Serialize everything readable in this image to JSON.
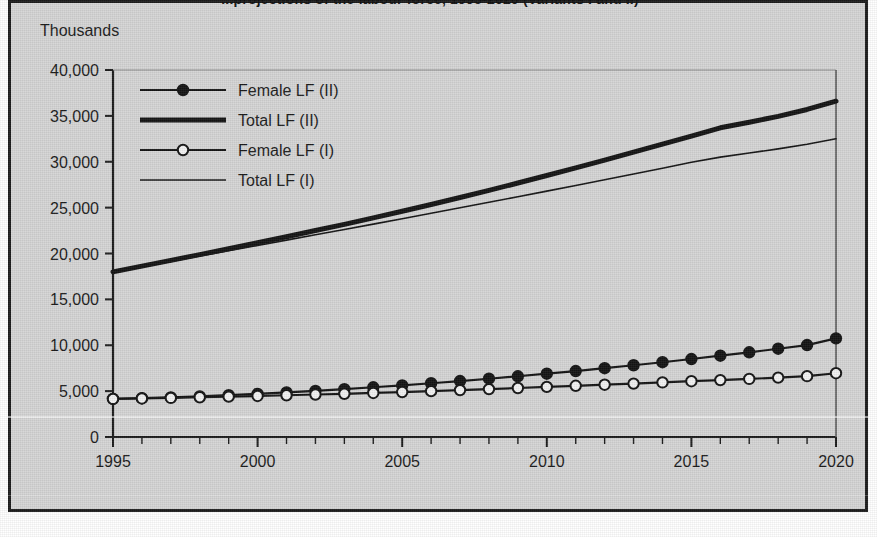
{
  "figure": {
    "title": "...projections of the labour force, 1995-2020 (Variants I and II)",
    "background_color": "#d5d5d5",
    "frame_color": "#1c1c1c"
  },
  "axes": {
    "y_unit_label": "Thousands",
    "y_ticks": [
      "0",
      "5,000",
      "10,000",
      "15,000",
      "20,000",
      "25,000",
      "30,000",
      "35,000",
      "40,000"
    ],
    "x_ticks": [
      "1995",
      "2000",
      "2005",
      "2010",
      "2015",
      "2020"
    ],
    "x_minor_tick_interval": 1
  },
  "legend": {
    "items": [
      {
        "label": "Female LF (II)",
        "marker": "filled-circle",
        "line_weight": "medium",
        "color": "#141414"
      },
      {
        "label": "Total LF (II)",
        "marker": "none",
        "line_weight": "thick",
        "color": "#141414"
      },
      {
        "label": "Female LF (I)",
        "marker": "open-circle",
        "line_weight": "medium",
        "color": "#141414"
      },
      {
        "label": "Total LF (I)",
        "marker": "none",
        "line_weight": "thin",
        "color": "#141414"
      }
    ]
  },
  "chart_data": {
    "type": "line",
    "title": "...projections of the labour force, 1995-2020 (Variants I and II)",
    "xlabel": "",
    "ylabel": "Thousands",
    "xlim": [
      1995,
      2020
    ],
    "ylim": [
      0,
      40000
    ],
    "grid": false,
    "legend_position": "top-left-inside",
    "x": [
      1995,
      1996,
      1997,
      1998,
      1999,
      2000,
      2001,
      2002,
      2003,
      2004,
      2005,
      2006,
      2007,
      2008,
      2009,
      2010,
      2011,
      2012,
      2013,
      2014,
      2015,
      2016,
      2017,
      2018,
      2019,
      2020
    ],
    "series": [
      {
        "name": "Total LF (II)",
        "marker": "none",
        "line_weight": "thick",
        "values": [
          18000,
          18620,
          19250,
          19880,
          20520,
          21170,
          21830,
          22500,
          23180,
          23880,
          24600,
          25340,
          26100,
          26880,
          27680,
          28500,
          29330,
          30180,
          31040,
          31920,
          32800,
          33700,
          34300,
          34950,
          35700,
          36600
        ]
      },
      {
        "name": "Total LF (I)",
        "marker": "none",
        "line_weight": "thin",
        "values": [
          18000,
          18570,
          19140,
          19720,
          20300,
          20880,
          21460,
          22040,
          22620,
          23200,
          23790,
          24380,
          24980,
          25580,
          26190,
          26800,
          27420,
          28040,
          28670,
          29300,
          29940,
          30500,
          30950,
          31400,
          31900,
          32500
        ]
      },
      {
        "name": "Female LF (II)",
        "marker": "filled-circle",
        "line_weight": "medium",
        "values": [
          4150,
          4230,
          4320,
          4430,
          4560,
          4700,
          4860,
          5030,
          5220,
          5420,
          5630,
          5860,
          6100,
          6350,
          6620,
          6900,
          7190,
          7500,
          7820,
          8150,
          8500,
          8860,
          9230,
          9620,
          10020,
          10750
        ]
      },
      {
        "name": "Female LF (I)",
        "marker": "open-circle",
        "line_weight": "medium",
        "values": [
          4150,
          4200,
          4260,
          4330,
          4400,
          4470,
          4550,
          4630,
          4710,
          4800,
          4900,
          5000,
          5110,
          5220,
          5340,
          5460,
          5580,
          5700,
          5820,
          5950,
          6080,
          6200,
          6330,
          6470,
          6630,
          6950
        ]
      }
    ]
  }
}
